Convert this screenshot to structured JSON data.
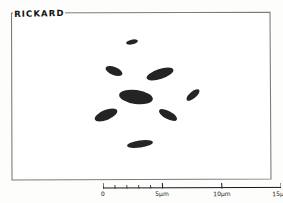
{
  "figure": {
    "kind": "pen-and-ink scientific illustration",
    "specimen_label": "RICKARD",
    "ink_color": "#111111",
    "paper_color": "#fdfdfc"
  },
  "plate": {
    "texture_name": "stipple-granular-matrix",
    "vortex_name": "spiral-hatch-vortex",
    "center_x_fraction": 0.46,
    "center_y_fraction": 0.49
  },
  "scalebar": {
    "name": "scale-bar",
    "unit": "µm",
    "ticks": [
      {
        "label": "0",
        "value": 0,
        "position": 0.0
      },
      {
        "label": "",
        "value": 1,
        "position": 0.0667
      },
      {
        "label": "",
        "value": 2,
        "position": 0.1333
      },
      {
        "label": "",
        "value": 3,
        "position": 0.2
      },
      {
        "label": "",
        "value": 4,
        "position": 0.2667
      },
      {
        "label": "5µm",
        "value": 5,
        "position": 0.3333
      },
      {
        "label": "10µm",
        "value": 10,
        "position": 0.6667
      },
      {
        "label": "15µm",
        "value": 15,
        "position": 1.0
      }
    ],
    "range_min": 0,
    "range_max": 15
  }
}
